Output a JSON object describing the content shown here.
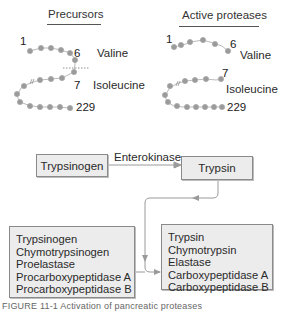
{
  "panels": {
    "precursors": {
      "title": "Precursors",
      "label_1": "1",
      "label_6": "6",
      "label_7": "7",
      "label_229": "229",
      "residue_6": "Valine",
      "residue_7": "Isoleucine"
    },
    "active": {
      "title": "Active proteases",
      "label_1": "1",
      "label_6": "6",
      "label_7": "7",
      "label_229": "229",
      "residue_6": "Valine",
      "residue_7": "Isoleucine"
    }
  },
  "flow": {
    "source_box": "Trypsinogen",
    "enzyme_label": "Enterokinase",
    "target_box": "Trypsin"
  },
  "zymogens": {
    "items": [
      "Trypsinogen",
      "Chymotrypsinogen",
      "Proelastase",
      "Procarboxypeptidase A",
      "Procarboxypeptidase B"
    ]
  },
  "active_enzymes": {
    "items": [
      "Trypsin",
      "Chymotrypsin",
      "Elastase",
      "Carboxypeptidase A",
      "Carboxypeptidase B"
    ]
  },
  "caption": "FIGURE 11-1 Activation of pancreatic proteases",
  "colors": {
    "bead": "#9a9a9a",
    "box_fill": "#ececec",
    "box_border": "#8a8a8a",
    "arrow": "#9a9a9a"
  }
}
